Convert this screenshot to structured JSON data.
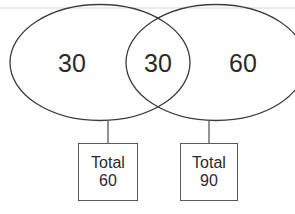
{
  "diagram": {
    "type": "venn-diagram",
    "title": "",
    "sets": [
      {
        "name": "left-set",
        "only_count": "30",
        "total_label": "Total",
        "total_value": "60"
      },
      {
        "name": "right-set",
        "only_count": "60",
        "total_label": "Total",
        "total_value": "90"
      }
    ],
    "overlap_count": "30",
    "labels": {
      "left_only": "30",
      "overlap": "30",
      "right_only": "60"
    },
    "totals": [
      {
        "word": "Total",
        "value": "60"
      },
      {
        "word": "Total",
        "value": "90"
      }
    ],
    "colors": {
      "stroke": "#3c3c3c",
      "box_stroke": "#5a5a5a",
      "text": "#2a2a2a",
      "background": "#ffffff"
    }
  }
}
